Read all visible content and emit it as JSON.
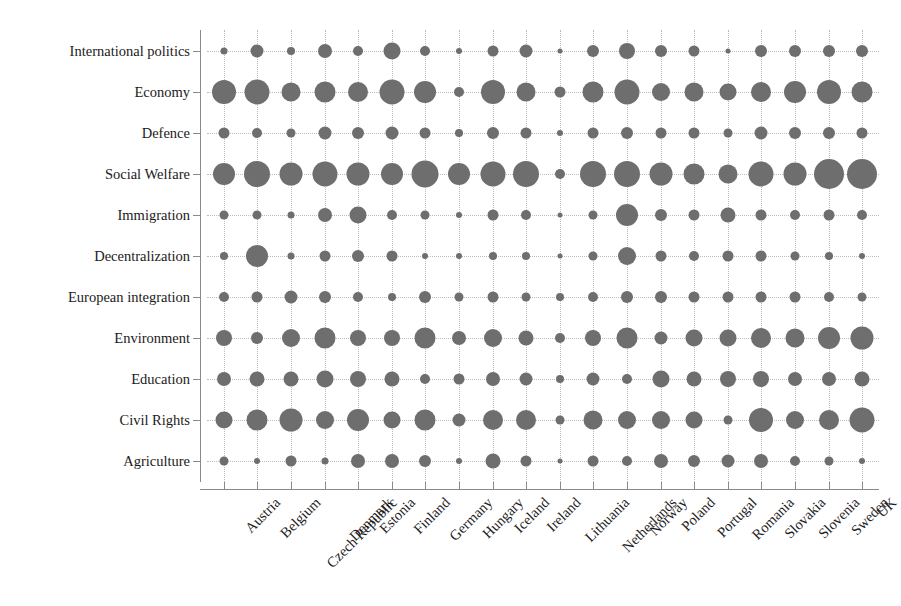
{
  "chart_data": {
    "type": "scatter",
    "subtype": "bubble-matrix",
    "title": "",
    "xlabel": "",
    "ylabel": "",
    "grid": "dotted",
    "legend": "none",
    "marker_color": "#6e6e6e",
    "categories": [
      "Austria",
      "Belgium",
      "Czech Republic",
      "Denmark",
      "Estonia",
      "Finland",
      "Germany",
      "Hungary",
      "Iceland",
      "Ireland",
      "Lithuania",
      "Netherlands",
      "Norway",
      "Poland",
      "Portugal",
      "Romania",
      "Slovakia",
      "Slovenia",
      "Sweden",
      "UK"
    ],
    "y_categories": [
      "International politics",
      "Economy",
      "Defence",
      "Social Welfare",
      "Immigration",
      "Decentralization",
      "European integration",
      "Environment",
      "Education",
      "Civil Rights",
      "Agriculture"
    ],
    "value_unit": "bubble diameter (px)",
    "series": [
      {
        "name": "International politics",
        "values": [
          7,
          13,
          8,
          14,
          10,
          17,
          10,
          6,
          11,
          13,
          5,
          12,
          16,
          12,
          11,
          5,
          12,
          12,
          12,
          12
        ]
      },
      {
        "name": "Economy",
        "values": [
          24,
          25,
          19,
          21,
          20,
          25,
          22,
          10,
          24,
          19,
          11,
          21,
          25,
          18,
          19,
          17,
          20,
          22,
          24,
          21
        ]
      },
      {
        "name": "Defence",
        "values": [
          11,
          10,
          9,
          13,
          12,
          13,
          11,
          8,
          12,
          11,
          6,
          11,
          12,
          11,
          11,
          9,
          13,
          12,
          12,
          11
        ]
      },
      {
        "name": "Social Welfare",
        "values": [
          22,
          26,
          23,
          25,
          23,
          22,
          27,
          22,
          25,
          26,
          10,
          26,
          26,
          23,
          21,
          19,
          25,
          23,
          30,
          30
        ]
      },
      {
        "name": "Immigration",
        "values": [
          9,
          9,
          7,
          14,
          17,
          10,
          9,
          6,
          11,
          10,
          5,
          9,
          22,
          12,
          11,
          15,
          11,
          10,
          11,
          10
        ]
      },
      {
        "name": "Decentralization",
        "values": [
          8,
          22,
          7,
          11,
          12,
          11,
          6,
          6,
          8,
          8,
          5,
          9,
          18,
          11,
          10,
          11,
          11,
          9,
          8,
          6
        ]
      },
      {
        "name": "European integration",
        "values": [
          10,
          11,
          13,
          12,
          10,
          8,
          12,
          9,
          11,
          9,
          8,
          10,
          12,
          12,
          11,
          11,
          11,
          11,
          10,
          9
        ]
      },
      {
        "name": "Environment",
        "values": [
          16,
          12,
          18,
          21,
          16,
          16,
          21,
          14,
          18,
          15,
          10,
          16,
          21,
          13,
          17,
          17,
          20,
          19,
          22,
          23
        ]
      },
      {
        "name": "Education",
        "values": [
          14,
          15,
          15,
          17,
          16,
          15,
          10,
          11,
          14,
          13,
          8,
          13,
          10,
          17,
          15,
          16,
          16,
          14,
          14,
          15
        ]
      },
      {
        "name": "Civil Rights",
        "values": [
          17,
          21,
          23,
          18,
          22,
          17,
          21,
          13,
          20,
          20,
          9,
          19,
          18,
          18,
          17,
          9,
          24,
          18,
          20,
          25
        ]
      },
      {
        "name": "Agriculture",
        "values": [
          9,
          6,
          11,
          7,
          14,
          14,
          12,
          6,
          15,
          11,
          5,
          11,
          10,
          14,
          12,
          13,
          14,
          10,
          9,
          6
        ]
      }
    ],
    "axis_style": {
      "x_tick_labels_rotated_deg": -45,
      "x_axis_line": true,
      "y_axis_line": true,
      "background": "#ffffff"
    }
  }
}
